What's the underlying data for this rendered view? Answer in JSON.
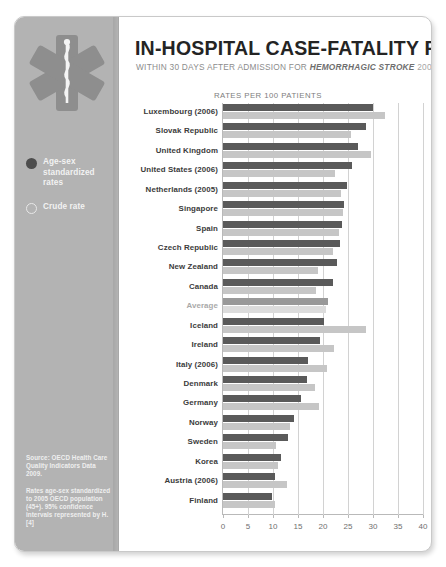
{
  "poster": {
    "title": "IN-HOSPITAL CASE-FATALITY RATES",
    "subtitle_prefix": "WITHIN 30 DAYS AFTER ADMISSION FOR ",
    "subtitle_emphasis": "HEMORRHAGIC STROKE",
    "subtitle_year": " 2007",
    "axis_title": "RATES PER 100 PATIENTS"
  },
  "sidebar": {
    "icon": "star-of-life-icon",
    "legend": [
      {
        "marker": "filled-dot",
        "label": "Age-sex standardized rates",
        "color": "#4d4d4d"
      },
      {
        "marker": "hollow-dot",
        "label": "Crude rate",
        "color": "#e8e8e8"
      }
    ],
    "source_paragraphs": [
      "Source: OECD Health Care Quality Indicators Data 2009.",
      "Rates age-sex standardized to 2005 OECD population (45+). 95% confidence intervals represented by H. [4]"
    ]
  },
  "chart_data": {
    "type": "bar",
    "orientation": "horizontal",
    "title": "IN-HOSPITAL CASE-FATALITY RATES",
    "subtitle": "WITHIN 30 DAYS AFTER ADMISSION FOR HEMORRHAGIC STROKE 2007",
    "xlabel": "RATES PER 100 PATIENTS",
    "ylabel": "",
    "xlim": [
      0,
      40
    ],
    "xticks": [
      0,
      5,
      10,
      15,
      20,
      25,
      30,
      35,
      40
    ],
    "grid": true,
    "legend_position": "left-sidebar",
    "categories": [
      "Luxembourg (2006)",
      "Slovak Republic",
      "United Kingdom",
      "United States (2006)",
      "Netherlands (2005)",
      "Singapore",
      "Spain",
      "Czech Republic",
      "New Zealand",
      "Canada",
      "Average",
      "Iceland",
      "Ireland",
      "Italy (2006)",
      "Denmark",
      "Germany",
      "Norway",
      "Sweden",
      "Korea",
      "Austria (2006)",
      "Finland"
    ],
    "series": [
      {
        "name": "Age-sex standardized rates",
        "color": "#5a5a5a",
        "values": [
          30.0,
          28.6,
          27.0,
          25.8,
          24.8,
          24.2,
          23.8,
          23.4,
          22.8,
          22.0,
          21.0,
          20.2,
          19.4,
          17.0,
          16.8,
          15.6,
          14.2,
          13.0,
          11.6,
          10.4,
          9.8
        ]
      },
      {
        "name": "Crude rate",
        "color": "#c6c6c6",
        "values": [
          32.4,
          25.6,
          29.6,
          22.4,
          23.6,
          24.0,
          23.2,
          22.0,
          19.0,
          18.6,
          20.6,
          28.6,
          22.2,
          20.8,
          18.4,
          19.2,
          13.4,
          10.6,
          11.0,
          12.8,
          10.4
        ]
      }
    ]
  }
}
